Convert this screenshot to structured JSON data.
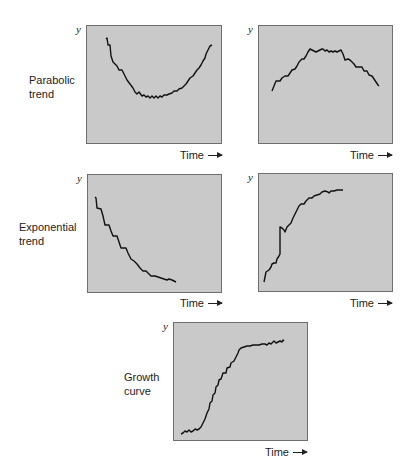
{
  "chart_data": [
    {
      "type": "line",
      "title": "Parabolic trend (U-shaped)",
      "row_label": "Parabolic trend",
      "xlabel": "Time",
      "ylabel": "y",
      "grid": false,
      "shape": "decreasing then increasing",
      "points": [
        [
          19,
          13
        ],
        [
          20,
          12
        ],
        [
          21,
          19
        ],
        [
          23,
          19
        ],
        [
          24,
          30
        ],
        [
          26,
          36
        ],
        [
          30,
          40
        ],
        [
          32,
          44
        ],
        [
          35,
          44
        ],
        [
          37,
          48
        ],
        [
          40,
          54
        ],
        [
          43,
          58
        ],
        [
          46,
          62
        ],
        [
          48,
          66
        ],
        [
          50,
          68
        ],
        [
          52,
          66
        ],
        [
          55,
          70
        ],
        [
          57,
          69
        ],
        [
          59,
          71
        ],
        [
          61,
          70
        ],
        [
          63,
          72
        ],
        [
          65,
          70
        ],
        [
          67,
          72
        ],
        [
          69,
          70
        ],
        [
          71,
          72
        ],
        [
          73,
          70
        ],
        [
          75,
          71
        ],
        [
          77,
          69
        ],
        [
          80,
          69
        ],
        [
          82,
          68
        ],
        [
          85,
          67
        ],
        [
          87,
          65
        ],
        [
          90,
          65
        ],
        [
          92,
          63
        ],
        [
          95,
          62
        ],
        [
          97,
          60
        ],
        [
          99,
          58
        ],
        [
          101,
          55
        ],
        [
          103,
          52
        ],
        [
          106,
          50
        ],
        [
          108,
          47
        ],
        [
          110,
          44
        ],
        [
          112,
          42
        ],
        [
          114,
          39
        ],
        [
          116,
          35
        ],
        [
          118,
          32
        ],
        [
          119,
          28
        ],
        [
          121,
          24
        ],
        [
          123,
          20
        ],
        [
          125,
          19
        ]
      ]
    },
    {
      "type": "line",
      "title": "Parabolic trend (inverted U)",
      "row_label": "Parabolic trend",
      "xlabel": "Time",
      "ylabel": "y",
      "grid": false,
      "shape": "increasing then decreasing",
      "points": [
        [
          13,
          65
        ],
        [
          15,
          60
        ],
        [
          17,
          55
        ],
        [
          21,
          55
        ],
        [
          23,
          52
        ],
        [
          26,
          50
        ],
        [
          29,
          50
        ],
        [
          31,
          47
        ],
        [
          33,
          44
        ],
        [
          36,
          43
        ],
        [
          38,
          40
        ],
        [
          40,
          36
        ],
        [
          43,
          33
        ],
        [
          45,
          33
        ],
        [
          47,
          30
        ],
        [
          49,
          26
        ],
        [
          51,
          23
        ],
        [
          53,
          24
        ],
        [
          55,
          25
        ],
        [
          57,
          26
        ],
        [
          59,
          25
        ],
        [
          61,
          24
        ],
        [
          63,
          23
        ],
        [
          64,
          23
        ],
        [
          66,
          25
        ],
        [
          68,
          24
        ],
        [
          70,
          26
        ],
        [
          72,
          25
        ],
        [
          74,
          26
        ],
        [
          76,
          25
        ],
        [
          78,
          26
        ],
        [
          80,
          25
        ],
        [
          82,
          24
        ],
        [
          84,
          28
        ],
        [
          86,
          34
        ],
        [
          89,
          33
        ],
        [
          91,
          34
        ],
        [
          93,
          36
        ],
        [
          95,
          38
        ],
        [
          97,
          41
        ],
        [
          101,
          41
        ],
        [
          103,
          41
        ],
        [
          105,
          45
        ],
        [
          108,
          45
        ],
        [
          110,
          49
        ],
        [
          113,
          50
        ],
        [
          115,
          53
        ],
        [
          117,
          56
        ],
        [
          119,
          59
        ],
        [
          120,
          60
        ]
      ]
    },
    {
      "type": "line",
      "title": "Exponential trend (decay)",
      "row_label": "Exponential trend",
      "xlabel": "Time",
      "ylabel": "y",
      "grid": false,
      "shape": "exponential decrease",
      "points": [
        [
          7,
          22
        ],
        [
          8,
          23
        ],
        [
          9,
          33
        ],
        [
          13,
          34
        ],
        [
          15,
          41
        ],
        [
          17,
          50
        ],
        [
          21,
          50
        ],
        [
          23,
          56
        ],
        [
          25,
          61
        ],
        [
          29,
          61
        ],
        [
          31,
          67
        ],
        [
          33,
          73
        ],
        [
          38,
          73
        ],
        [
          40,
          78
        ],
        [
          43,
          84
        ],
        [
          46,
          86
        ],
        [
          49,
          89
        ],
        [
          52,
          93
        ],
        [
          55,
          96
        ],
        [
          58,
          96
        ],
        [
          61,
          99
        ],
        [
          63,
          101
        ],
        [
          67,
          101
        ],
        [
          70,
          102
        ],
        [
          73,
          103
        ],
        [
          76,
          104
        ],
        [
          79,
          105
        ],
        [
          81,
          104
        ],
        [
          84,
          105
        ],
        [
          86,
          106
        ],
        [
          88,
          107
        ]
      ]
    },
    {
      "type": "line",
      "title": "Exponential trend (saturating growth)",
      "row_label": "Exponential trend",
      "xlabel": "Time",
      "ylabel": "y",
      "grid": false,
      "shape": "rapid increase leveling off",
      "points": [
        [
          5,
          108
        ],
        [
          7,
          98
        ],
        [
          10,
          96
        ],
        [
          12,
          93
        ],
        [
          13,
          90
        ],
        [
          15,
          89
        ],
        [
          17,
          89
        ],
        [
          18,
          85
        ],
        [
          20,
          82
        ],
        [
          21,
          80
        ],
        [
          21,
          62
        ],
        [
          21,
          53
        ],
        [
          23,
          54
        ],
        [
          25,
          56
        ],
        [
          26,
          58
        ],
        [
          28,
          53
        ],
        [
          30,
          51
        ],
        [
          32,
          49
        ],
        [
          34,
          44
        ],
        [
          36,
          40
        ],
        [
          38,
          36
        ],
        [
          40,
          32
        ],
        [
          42,
          30
        ],
        [
          45,
          30
        ],
        [
          47,
          27
        ],
        [
          50,
          24
        ],
        [
          53,
          24
        ],
        [
          55,
          22
        ],
        [
          58,
          21
        ],
        [
          61,
          20
        ],
        [
          63,
          18
        ],
        [
          66,
          17
        ],
        [
          69,
          18
        ],
        [
          70,
          19
        ],
        [
          72,
          17
        ],
        [
          75,
          17
        ],
        [
          78,
          16
        ],
        [
          81,
          16
        ],
        [
          84,
          16
        ]
      ]
    },
    {
      "type": "line",
      "title": "Growth curve (S-shaped)",
      "row_label": "Growth curve",
      "xlabel": "Time",
      "ylabel": "y",
      "grid": false,
      "shape": "sigmoid",
      "points": [
        [
          7,
          111
        ],
        [
          9,
          110
        ],
        [
          11,
          108
        ],
        [
          13,
          109
        ],
        [
          15,
          107
        ],
        [
          17,
          109
        ],
        [
          19,
          108
        ],
        [
          21,
          106
        ],
        [
          23,
          107
        ],
        [
          25,
          106
        ],
        [
          27,
          104
        ],
        [
          29,
          100
        ],
        [
          31,
          96
        ],
        [
          33,
          90
        ],
        [
          35,
          86
        ],
        [
          36,
          80
        ],
        [
          38,
          78
        ],
        [
          39,
          72
        ],
        [
          41,
          70
        ],
        [
          42,
          64
        ],
        [
          44,
          62
        ],
        [
          45,
          57
        ],
        [
          47,
          56
        ],
        [
          49,
          50
        ],
        [
          52,
          50
        ],
        [
          53,
          45
        ],
        [
          56,
          44
        ],
        [
          57,
          40
        ],
        [
          60,
          38
        ],
        [
          62,
          34
        ],
        [
          64,
          30
        ],
        [
          65,
          27
        ],
        [
          67,
          25
        ],
        [
          70,
          24
        ],
        [
          73,
          23
        ],
        [
          76,
          23
        ],
        [
          79,
          22
        ],
        [
          82,
          22
        ],
        [
          85,
          22
        ],
        [
          88,
          21
        ],
        [
          91,
          21
        ],
        [
          93,
          22
        ],
        [
          95,
          20
        ],
        [
          97,
          21
        ],
        [
          99,
          19
        ],
        [
          100,
          18
        ],
        [
          102,
          20
        ],
        [
          104,
          19
        ],
        [
          106,
          18
        ],
        [
          108,
          19
        ],
        [
          109,
          17
        ],
        [
          110,
          18
        ]
      ]
    }
  ],
  "labels": {
    "row1_line1": "Parabolic",
    "row1_line2": "trend",
    "row2_line1": "Exponential",
    "row2_line2": "trend",
    "row3_line1": "Growth",
    "row3_line2": "curve",
    "y_axis": "y",
    "x_axis": "Time"
  },
  "colors": {
    "panel_fill": "#c9c9c9",
    "panel_border": "#6e6e6e",
    "line": "#111111"
  }
}
